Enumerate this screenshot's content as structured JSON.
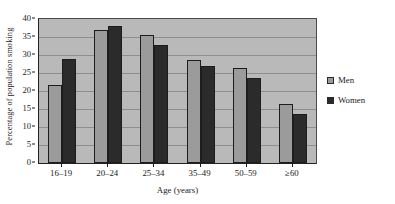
{
  "chart_data": {
    "type": "bar",
    "title": "",
    "subtitle": "",
    "xlabel": "Age (years)",
    "ylabel": "Percentage of population smoking",
    "categories": [
      "16–19",
      "20–24",
      "25–34",
      "35–49",
      "50–59",
      "≥60"
    ],
    "series": [
      {
        "name": "Men",
        "color": "#9b9b9b",
        "values": [
          21.8,
          37.0,
          35.5,
          28.5,
          26.3,
          16.5
        ]
      },
      {
        "name": "Women",
        "color": "#2b2b2b",
        "values": [
          29.0,
          38.0,
          32.8,
          27.0,
          23.5,
          13.5
        ]
      }
    ],
    "ylim": [
      0,
      40
    ],
    "ytick_labels": [
      "0",
      "5",
      "10",
      "15",
      "20",
      "25",
      "30",
      "35",
      "40"
    ],
    "ytick_values": [
      0,
      5,
      10,
      15,
      20,
      25,
      30,
      35,
      40
    ],
    "grid": true,
    "grid_axis": "y",
    "legend_position": "right",
    "plot_background": "#b9b9b9",
    "figure_background": "#ffffff"
  },
  "legend": {
    "items": [
      {
        "label": "Men"
      },
      {
        "label": "Women"
      }
    ]
  }
}
